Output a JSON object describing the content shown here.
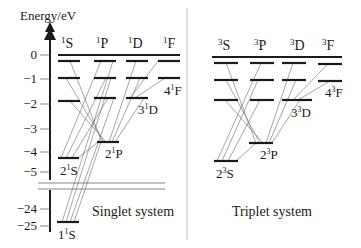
{
  "axis": {
    "title": "Energy/eV",
    "ticks": [
      {
        "label": "0",
        "y": 55
      },
      {
        "label": "−1",
        "y": 79
      },
      {
        "label": "−2",
        "y": 104
      },
      {
        "label": "−3",
        "y": 129
      },
      {
        "label": "−4",
        "y": 152
      },
      {
        "label": "−5",
        "y": 172
      },
      {
        "label": "−24",
        "y": 209
      },
      {
        "label": "−25",
        "y": 226
      }
    ]
  },
  "singlet": {
    "caption": "Singlet system",
    "columns": [
      {
        "sup": "1",
        "letter": "S"
      },
      {
        "sup": "1",
        "letter": "P"
      },
      {
        "sup": "1",
        "letter": "D"
      },
      {
        "sup": "1",
        "letter": "F"
      }
    ],
    "state_labels": {
      "s2": {
        "n": "2",
        "sup": "1",
        "letter": "S"
      },
      "p2": {
        "n": "2",
        "sup": "1",
        "letter": "P"
      },
      "d3": {
        "n": "3",
        "sup": "1",
        "letter": "D"
      },
      "f4": {
        "n": "4",
        "sup": "1",
        "letter": "F"
      },
      "s1": {
        "n": "1",
        "sup": "1",
        "letter": "S"
      }
    }
  },
  "triplet": {
    "caption": "Triplet system",
    "columns": [
      {
        "sup": "3",
        "letter": "S"
      },
      {
        "sup": "3",
        "letter": "P"
      },
      {
        "sup": "3",
        "letter": "D"
      },
      {
        "sup": "3",
        "letter": "F"
      }
    ],
    "state_labels": {
      "s2": {
        "n": "2",
        "sup": "3",
        "letter": "S"
      },
      "p2": {
        "n": "2",
        "sup": "3",
        "letter": "P"
      },
      "d3": {
        "n": "3",
        "sup": "3",
        "letter": "D"
      },
      "f4": {
        "n": "4",
        "sup": "3",
        "letter": "F"
      }
    }
  },
  "colors": {
    "ink": "#1a1a1a",
    "transition": "#6a6a6a",
    "divider": "#b0b0b0"
  }
}
